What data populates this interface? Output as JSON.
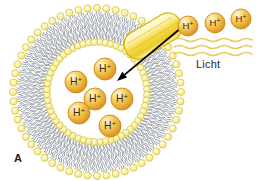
{
  "figure": {
    "panel_label": "A",
    "background_color": "#ffffff",
    "width": 263,
    "height": 181,
    "description_kind": "proton-pumping-vesicle-diagram"
  },
  "labels": {
    "light_label": "Licht",
    "light_label_color": "#2b2b2b",
    "panel_label": "A",
    "panel_label_color": "#1a1a1a"
  },
  "colors": {
    "lipid_head_fill": "#f7f0a4",
    "lipid_head_stroke": "#d9c43c",
    "lipid_tail_stroke": "#8d939c",
    "ion_fill_light": "#fff4cf",
    "ion_fill_mid": "#f0c043",
    "ion_fill_dark": "#dd8e1c",
    "ion_stroke": "#c98a18",
    "ion_label_color": "#3a2a10",
    "protein_fill_light": "#fffbe0",
    "protein_fill_mid": "#f5dd52",
    "protein_fill_dark": "#e8c41f",
    "protein_stroke": "#d6b400",
    "arrow_color": "#000000",
    "light_ray_color": "#e9c84d",
    "lumen_fill": "#ffffff"
  },
  "vesicle": {
    "center_x": 97,
    "center_y": 92,
    "lumen_radius": 45,
    "inner_head_radius": 50,
    "outer_head_radius": 84,
    "lipid_count": 56,
    "tail_length": 30
  },
  "protein": {
    "name": "bacteriorhodopsin-cylinder",
    "center_x": 153,
    "center_y": 36,
    "length": 62,
    "width": 28,
    "rotation_deg": -31
  },
  "arrow": {
    "name": "proton-transport-arrow",
    "start_x": 181,
    "start_y": 28,
    "end_x": 117,
    "end_y": 81,
    "color": "#000000"
  },
  "ions_inside": {
    "label": "H+",
    "superscript": "+",
    "radius": 11,
    "items": [
      {
        "x": 105,
        "y": 69
      },
      {
        "x": 76,
        "y": 82
      },
      {
        "x": 95,
        "y": 99
      },
      {
        "x": 122,
        "y": 99
      },
      {
        "x": 79,
        "y": 113
      },
      {
        "x": 110,
        "y": 126
      }
    ]
  },
  "ions_outside": {
    "label": "H+",
    "radius": 10,
    "items": [
      {
        "x": 188,
        "y": 26
      },
      {
        "x": 215,
        "y": 23
      },
      {
        "x": 241,
        "y": 19
      }
    ]
  },
  "light_rays": {
    "name": "light-waves",
    "count": 3,
    "x_start": 174,
    "x_end": 252,
    "y_positions": [
      40,
      47,
      54
    ],
    "color": "#e9c84d"
  }
}
